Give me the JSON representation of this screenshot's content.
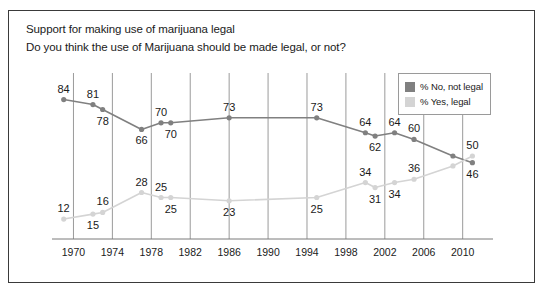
{
  "header": {
    "title": "Support for making use of marijuana legal",
    "subtitle": "Do you think the use of Marijuana should be made legal, or not?"
  },
  "legend": {
    "position": "top-right",
    "items": [
      {
        "label": "% No, not legal",
        "color": "#808080",
        "swatch_name": "legend-swatch-no"
      },
      {
        "label": "% Yes, legal",
        "color": "#d4d4d4",
        "swatch_name": "legend-swatch-yes"
      }
    ]
  },
  "axis": {
    "ticks": [
      "1970",
      "1974",
      "1978",
      "1982",
      "1986",
      "1990",
      "1994",
      "1998",
      "2002",
      "2006",
      "2010"
    ],
    "tick_values": [
      1970,
      1974,
      1978,
      1982,
      1986,
      1990,
      1994,
      1998,
      2002,
      2006,
      2010
    ],
    "xmin": 1968,
    "xmax": 2012.5
  },
  "colors": {
    "no_series": "#808080",
    "yes_series": "#d4d4d4",
    "gridline": "#9a9a9a",
    "axis": "#7a7a7a",
    "border": "#3a3a3a",
    "text": "#1a1a1a"
  },
  "chart_data": {
    "type": "line",
    "title": "Support for making use of marijuana legal",
    "subtitle": "Do you think the use of Marijuana should be made legal, or not?",
    "xlabel": "",
    "ylabel": "",
    "xlim": [
      1968,
      2012.5
    ],
    "ylim": [
      0,
      100
    ],
    "grid": "vertical",
    "legend_position": "top-right",
    "series": [
      {
        "name": "% No, not legal",
        "color": "#808080",
        "points": [
          {
            "x": 1969,
            "y": 84,
            "label": "84",
            "label_pos": "above-left"
          },
          {
            "x": 1972,
            "y": 81,
            "label": "81",
            "label_pos": "above"
          },
          {
            "x": 1973,
            "y": 78,
            "label": "78",
            "label_pos": "below"
          },
          {
            "x": 1977,
            "y": 66,
            "label": "66",
            "label_pos": "below"
          },
          {
            "x": 1979,
            "y": 70,
            "label": "70",
            "label_pos": "above"
          },
          {
            "x": 1980,
            "y": 70,
            "label": "70",
            "label_pos": "below"
          },
          {
            "x": 1986,
            "y": 73,
            "label": "73",
            "label_pos": "above"
          },
          {
            "x": 1995,
            "y": 73,
            "label": "73",
            "label_pos": "above"
          },
          {
            "x": 2000,
            "y": 64,
            "label": "64",
            "label_pos": "above"
          },
          {
            "x": 2001,
            "y": 62,
            "label": "62",
            "label_pos": "below"
          },
          {
            "x": 2003,
            "y": 64,
            "label": "64",
            "label_pos": "above"
          },
          {
            "x": 2005,
            "y": 60,
            "label": "60",
            "label_pos": "above"
          },
          {
            "x": 2009,
            "y": 50,
            "label": null,
            "label_pos": null
          },
          {
            "x": 2011,
            "y": 46,
            "label": "46",
            "label_pos": "below"
          }
        ]
      },
      {
        "name": "% Yes, legal",
        "color": "#d4d4d4",
        "points": [
          {
            "x": 1969,
            "y": 12,
            "label": "12",
            "label_pos": "above-left"
          },
          {
            "x": 1972,
            "y": 15,
            "label": "15",
            "label_pos": "below"
          },
          {
            "x": 1973,
            "y": 16,
            "label": "16",
            "label_pos": "above"
          },
          {
            "x": 1977,
            "y": 28,
            "label": "28",
            "label_pos": "above"
          },
          {
            "x": 1979,
            "y": 25,
            "label": "25",
            "label_pos": "above"
          },
          {
            "x": 1980,
            "y": 25,
            "label": "25",
            "label_pos": "below"
          },
          {
            "x": 1986,
            "y": 23,
            "label": "23",
            "label_pos": "below"
          },
          {
            "x": 1995,
            "y": 25,
            "label": "25",
            "label_pos": "below"
          },
          {
            "x": 2000,
            "y": 34,
            "label": "34",
            "label_pos": "above"
          },
          {
            "x": 2001,
            "y": 31,
            "label": "31",
            "label_pos": "below"
          },
          {
            "x": 2003,
            "y": 34,
            "label": "34",
            "label_pos": "below"
          },
          {
            "x": 2005,
            "y": 36,
            "label": "36",
            "label_pos": "above"
          },
          {
            "x": 2009,
            "y": 44,
            "label": null,
            "label_pos": null
          },
          {
            "x": 2011,
            "y": 50,
            "label": "50",
            "label_pos": "above"
          }
        ]
      }
    ]
  }
}
